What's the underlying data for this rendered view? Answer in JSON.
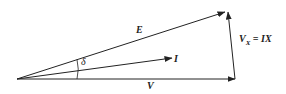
{
  "diagram": {
    "type": "phasor-diagram",
    "labels": {
      "E": "E",
      "I": "I",
      "V": "V",
      "delta": "δ",
      "Vx_main": "V",
      "Vx_sub": "X",
      "Vx_eq": " = IX"
    },
    "vectors": [
      {
        "name": "V",
        "from": [
          17,
          79
        ],
        "to": [
          235,
          79
        ]
      },
      {
        "name": "E",
        "from": [
          17,
          79
        ],
        "to": [
          225,
          12
        ]
      },
      {
        "name": "I",
        "from": [
          17,
          79
        ],
        "to": [
          172,
          58
        ]
      },
      {
        "name": "Vx",
        "from": [
          235,
          79
        ],
        "to": [
          228,
          12
        ]
      }
    ],
    "stroke_color": "#222222"
  }
}
